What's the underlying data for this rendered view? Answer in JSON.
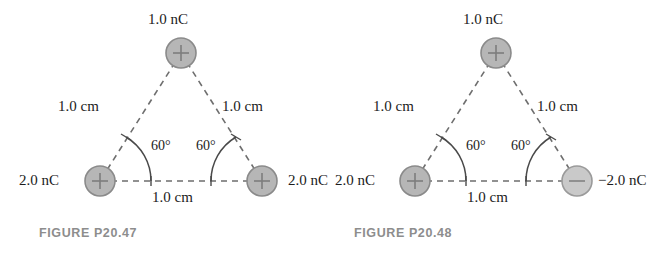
{
  "figures": [
    {
      "caption": "FIGURE P20.47",
      "charges": [
        {
          "name": "top-charge",
          "sign": "+",
          "label": "1.0 nC",
          "polarity": "positive"
        },
        {
          "name": "bottom-left-charge",
          "sign": "+",
          "label": "2.0 nC",
          "polarity": "positive"
        },
        {
          "name": "bottom-right-charge",
          "sign": "+",
          "label": "2.0 nC",
          "polarity": "positive"
        }
      ],
      "sides": {
        "left": "1.0 cm",
        "right": "1.0 cm",
        "bottom": "1.0 cm"
      },
      "angles": {
        "left": "60°",
        "right": "60°"
      }
    },
    {
      "caption": "FIGURE P20.48",
      "charges": [
        {
          "name": "top-charge",
          "sign": "+",
          "label": "1.0 nC",
          "polarity": "positive"
        },
        {
          "name": "bottom-left-charge",
          "sign": "+",
          "label": "2.0 nC",
          "polarity": "positive"
        },
        {
          "name": "bottom-right-charge",
          "sign": "−",
          "label": "−2.0 nC",
          "polarity": "negative"
        }
      ],
      "sides": {
        "left": "1.0 cm",
        "right": "1.0 cm",
        "bottom": "1.0 cm"
      },
      "angles": {
        "left": "60°",
        "right": "60°"
      }
    }
  ],
  "colors": {
    "positive_fill": "#b6b6b6",
    "positive_stroke": "#8a8a8a",
    "negative_fill": "#c9c9c9",
    "negative_stroke": "#9a9a9a",
    "line": "#6e6e6e",
    "text": "#1c1c1c",
    "caption": "#8d8d8d",
    "background": "#ffffff"
  }
}
